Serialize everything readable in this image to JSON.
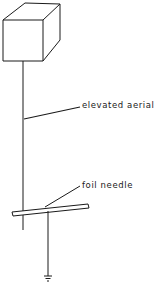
{
  "diagram": {
    "type": "schematic",
    "components": [
      {
        "id": "box",
        "shape": "cube"
      },
      {
        "id": "aerial",
        "shape": "vertical-wire"
      },
      {
        "id": "needle",
        "shape": "horizontal-bar"
      },
      {
        "id": "ground",
        "shape": "ground-symbol"
      }
    ],
    "labels": {
      "aerial": "elevated aerial",
      "needle": "foil needle"
    },
    "colors": {
      "line": "#1a1a1a",
      "background": "#ffffff"
    }
  }
}
